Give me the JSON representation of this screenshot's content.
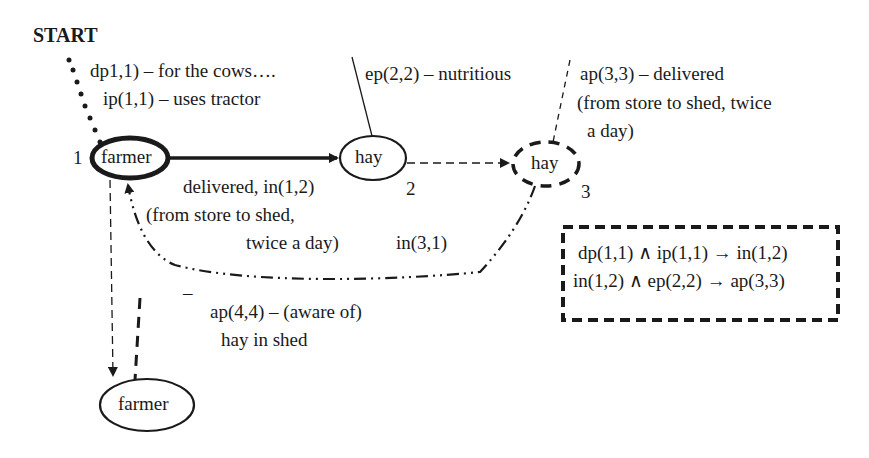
{
  "start_label": "START",
  "nodes": {
    "farmer1": {
      "label": "farmer",
      "number": "1"
    },
    "hay2": {
      "label": "hay",
      "number": "2"
    },
    "hay3": {
      "label": "hay",
      "number": "3"
    },
    "farmer4": {
      "label": "farmer"
    }
  },
  "annotations": {
    "dp": "dp1,1) – for the cows….",
    "ip": "ip(1,1) – uses tractor",
    "ep": "ep(2,2) – nutritious",
    "ap3_line1": "ap(3,3) – delivered",
    "ap3_line2": "(from store to shed, twice",
    "ap3_line3": "a day)",
    "edge12_line1": "delivered, in(1,2)",
    "edge12_line2": "(from store to shed,",
    "edge12_line3": "twice a day)",
    "in31": "in(3,1)",
    "dash": "–",
    "ap4_line1": "ap(4,4) – (aware of)",
    "ap4_line2": "hay in shed"
  },
  "rules_box": {
    "rule1": "dp(1,1) ∧ ip(1,1) → in(1,2)",
    "rule2": "in(1,2) ∧ ep(2,2) → ap(3,3)"
  }
}
